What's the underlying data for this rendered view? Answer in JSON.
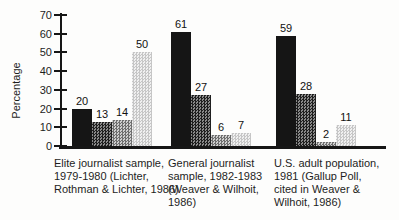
{
  "figure": {
    "background": "#fdfdfc",
    "axis_color": "#161616"
  },
  "chart_data": {
    "type": "bar",
    "title": "",
    "xlabel": "",
    "ylabel": "Percentage",
    "ylim": [
      0,
      70
    ],
    "yticks": [
      0,
      10,
      20,
      30,
      40,
      50,
      60,
      70
    ],
    "grid": false,
    "legend": "none",
    "bar_value_labels": true,
    "categories": [
      "Elite journalist sample, 1979-1980 (Lichter, Rothman & Lichter, 1986)",
      "General journalist sample, 1982-1983 (Weaver & Wilhoit, 1986)",
      "U.S. adult population, 1981 (Gallup Poll, cited in Weaver & Wilhoit, 1986)"
    ],
    "categories_wrapped": [
      [
        "Elite journalist sample,",
        "1979-1980 (Lichter,",
        "Rothman & Lichter, 1986)"
      ],
      [
        "General journalist",
        "sample, 1982-1983",
        "(Weaver & Wilhoit,",
        "1986)"
      ],
      [
        "U.S. adult population,",
        "1981 (Gallup Poll,",
        "cited in Weaver &",
        "Wilhoit, 1986)"
      ]
    ],
    "series": [
      {
        "name": "series-1-black",
        "pattern": "solid",
        "color": "#151515",
        "values": [
          20,
          61,
          59
        ]
      },
      {
        "name": "series-2-dark-gray",
        "pattern": "dark",
        "color": "#545454",
        "values": [
          13,
          27,
          28
        ]
      },
      {
        "name": "series-3-medium-gray",
        "pattern": "mid",
        "color": "#9c9c9c",
        "values": [
          14,
          6,
          2
        ]
      },
      {
        "name": "series-4-light-gray",
        "pattern": "light",
        "color": "#d8d8d8",
        "values": [
          50,
          7,
          11
        ]
      }
    ]
  }
}
